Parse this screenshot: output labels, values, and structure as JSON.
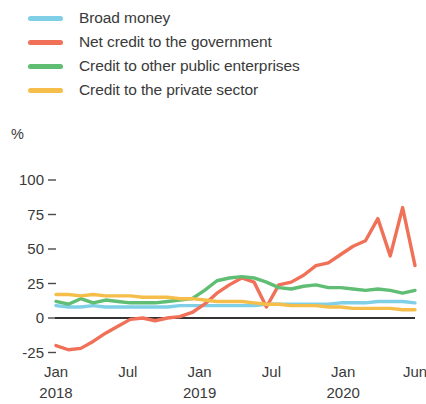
{
  "legend": {
    "position": "top-left",
    "items": [
      {
        "label": "Broad money",
        "color": "#7FCFE6",
        "swatch": "line-swatch"
      },
      {
        "label": "Net credit to the government",
        "color": "#F07058",
        "swatch": "line-swatch"
      },
      {
        "label": "Credit to other public enterprises",
        "color": "#5FBE74",
        "swatch": "line-swatch"
      },
      {
        "label": "Credit to the private sector",
        "color": "#F5BE4A",
        "swatch": "line-swatch"
      }
    ]
  },
  "axes": {
    "unit_label": "%",
    "y_ticks": [
      "100",
      "75",
      "50",
      "25",
      "0",
      "-25"
    ],
    "y_values": [
      100,
      75,
      50,
      25,
      0,
      -25
    ],
    "x_ticks": [
      {
        "month": "Jan",
        "year": "2018"
      },
      {
        "month": "Jul",
        "year": ""
      },
      {
        "month": "Jan",
        "year": "2019"
      },
      {
        "month": "Jul",
        "year": ""
      },
      {
        "month": "Jan",
        "year": "2020"
      },
      {
        "month": "Jun",
        "year": ""
      }
    ]
  },
  "chart_data": {
    "type": "line",
    "title": "",
    "xlabel": "",
    "ylabel": "%",
    "ylim": [
      -25,
      100
    ],
    "xlim": [
      0,
      29
    ],
    "grid": false,
    "legend_position": "top-left",
    "x": [
      "Jan 2018",
      "Feb 2018",
      "Mar 2018",
      "Apr 2018",
      "May 2018",
      "Jun 2018",
      "Jul 2018",
      "Aug 2018",
      "Sep 2018",
      "Oct 2018",
      "Nov 2018",
      "Dec 2018",
      "Jan 2019",
      "Feb 2019",
      "Mar 2019",
      "Apr 2019",
      "May 2019",
      "Jun 2019",
      "Jul 2019",
      "Aug 2019",
      "Sep 2019",
      "Oct 2019",
      "Nov 2019",
      "Dec 2019",
      "Jan 2020",
      "Feb 2020",
      "Mar 2020",
      "Apr 2020",
      "May 2020",
      "Jun 2020"
    ],
    "series": [
      {
        "name": "Broad money",
        "color": "#7FCFE6",
        "values": [
          9,
          8,
          8,
          9,
          8,
          8,
          8,
          8,
          8,
          8,
          9,
          9,
          9,
          9,
          9,
          9,
          9,
          10,
          10,
          10,
          10,
          10,
          10,
          11,
          11,
          11,
          12,
          12,
          12,
          11
        ]
      },
      {
        "name": "Net credit to the government",
        "color": "#F07058",
        "values": [
          -20,
          -23,
          -22,
          -17,
          -11,
          -6,
          -1,
          0,
          -2,
          0,
          1,
          4,
          10,
          18,
          24,
          29,
          26,
          8,
          24,
          26,
          31,
          38,
          40,
          46,
          52,
          56,
          72,
          45,
          80,
          38
        ]
      },
      {
        "name": "Credit to other public enterprises",
        "color": "#5FBE74",
        "values": [
          12,
          10,
          14,
          11,
          13,
          12,
          11,
          11,
          11,
          12,
          13,
          14,
          20,
          27,
          29,
          30,
          29,
          26,
          22,
          21,
          23,
          24,
          22,
          22,
          21,
          20,
          21,
          20,
          18,
          20
        ]
      },
      {
        "name": "Credit to the private sector",
        "color": "#F5BE4A",
        "values": [
          17,
          17,
          16,
          17,
          16,
          16,
          16,
          15,
          15,
          15,
          14,
          14,
          13,
          12,
          12,
          12,
          11,
          10,
          10,
          9,
          9,
          9,
          8,
          8,
          7,
          7,
          7,
          7,
          6,
          6
        ]
      }
    ],
    "annotations": []
  }
}
